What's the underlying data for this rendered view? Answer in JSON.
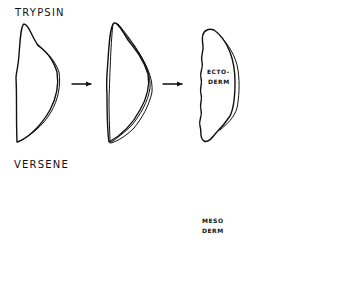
{
  "figure": {
    "rows": [
      {
        "label": "TRYPSIN",
        "stages": [
          {
            "name": "intact-explant"
          },
          {
            "name": "layers-separating"
          },
          {
            "name": "isolated-layer",
            "label_line1": "ECTO-",
            "label_line2": "DERM"
          }
        ]
      },
      {
        "label": "VERSENE",
        "stages": [
          {
            "name": "intact-explant"
          },
          {
            "name": "explant-with-cavities"
          },
          {
            "name": "isolated-layer",
            "label_line1": "MESO",
            "label_line2": "DERM"
          }
        ]
      }
    ],
    "result": {
      "name": "recombined-explant"
    },
    "colors": {
      "line": "#111111",
      "background": "#ffffff"
    }
  }
}
